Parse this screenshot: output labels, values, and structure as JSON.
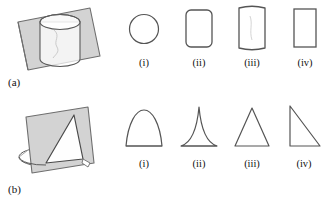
{
  "figure": {
    "stroke_color": "#4a4a4a",
    "plane_fill_color": "#d3d3d3",
    "plane_stroke_color": "#6e6e6e",
    "solid_fill_color": "#ffffff",
    "background_color": "#ffffff",
    "option_stroke_color": "#555555"
  },
  "panels": [
    {
      "id": "a",
      "label": "(a)",
      "solid": {
        "name": "cylinder-cut-by-vertical-plane",
        "solid_type": "cylinder",
        "plane_orientation": "vertical-parallel-to-axis"
      },
      "options": [
        {
          "caption": "(i)",
          "shape": "circle"
        },
        {
          "caption": "(ii)",
          "shape": "rounded-rectangle"
        },
        {
          "caption": "(iii)",
          "shape": "rectangle-with-curved-top-and-bottom"
        },
        {
          "caption": "(iv)",
          "shape": "rectangle"
        }
      ]
    },
    {
      "id": "b",
      "label": "(b)",
      "solid": {
        "name": "cone-cut-by-vertical-plane",
        "solid_type": "cone",
        "plane_orientation": "vertical-through-apex"
      },
      "options": [
        {
          "caption": "(i)",
          "shape": "arch-convex-sides"
        },
        {
          "caption": "(ii)",
          "shape": "cusp-concave-sides"
        },
        {
          "caption": "(iii)",
          "shape": "isosceles-triangle"
        },
        {
          "caption": "(iv)",
          "shape": "right-triangle"
        }
      ]
    }
  ]
}
